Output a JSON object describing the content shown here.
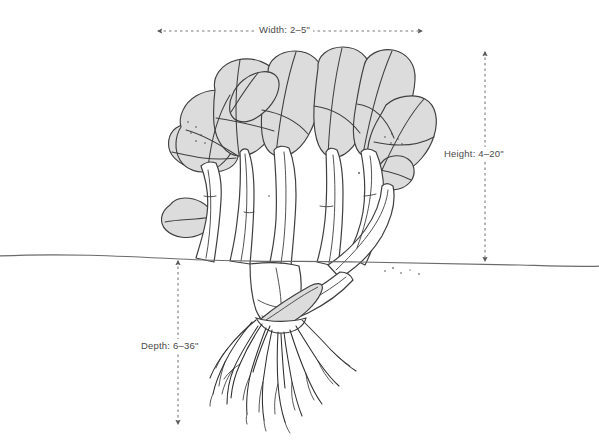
{
  "diagram": {
    "background_color": "#ffffff",
    "ink_color": "#3a3a3a",
    "leaf_fill_color": "#dcdcdc",
    "stalk_fill_color": "#ffffff",
    "label_text_color": "#4a4a4a",
    "dimension_line_color": "#7a7a7a"
  },
  "labels": {
    "width": "Width: 2–5\"",
    "height": "Height: 4–20\"",
    "depth": "Depth: 6–36\""
  },
  "dimensions": {
    "width": {
      "label": "Width",
      "min": 2,
      "max": 5,
      "unit": "in",
      "orientation": "horizontal"
    },
    "height": {
      "label": "Height",
      "min": 4,
      "max": 20,
      "unit": "in",
      "orientation": "vertical"
    },
    "depth": {
      "label": "Depth",
      "min": 6,
      "max": 36,
      "unit": "in",
      "orientation": "vertical"
    }
  },
  "icons": {
    "width_arrow_left": "arrow-left-icon",
    "width_arrow_right": "arrow-right-icon",
    "height_arrow_top": "arrow-up-icon",
    "height_arrow_bottom": "arrow-down-icon",
    "depth_arrow_top": "arrow-up-icon",
    "depth_arrow_bottom": "arrow-down-icon"
  },
  "ground": {
    "name": "soil-line",
    "y": 260
  }
}
